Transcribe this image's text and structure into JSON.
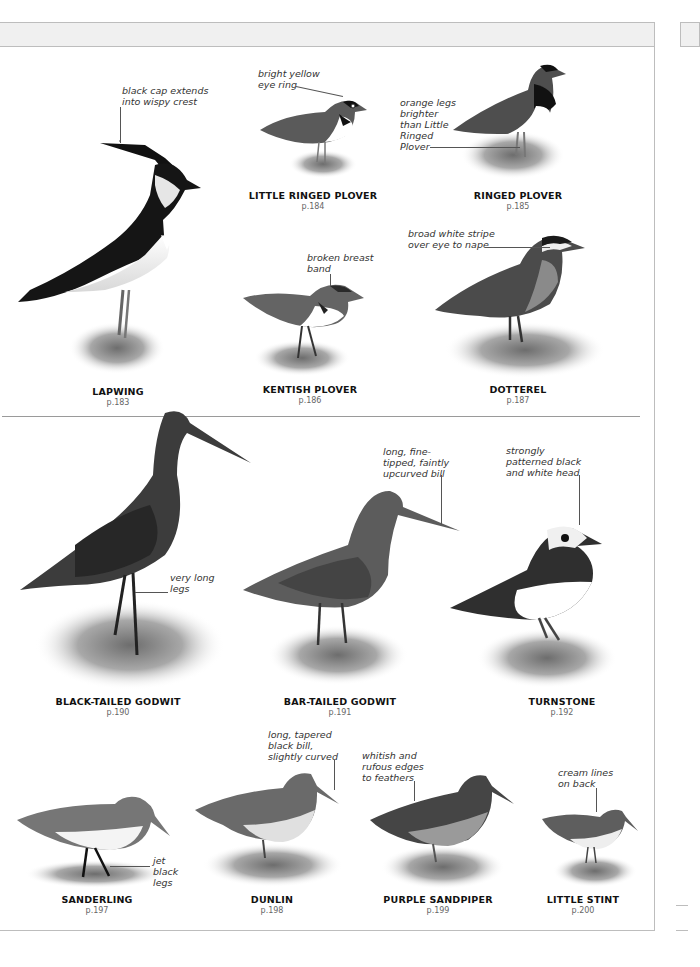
{
  "page": {
    "header_band": "",
    "sections": [
      {
        "id": "plovers",
        "species": [
          {
            "name": "LAPWING",
            "page": "p.183",
            "note": "black cap extends\ninto wispy crest"
          },
          {
            "name": "LITTLE RINGED PLOVER",
            "page": "p.184",
            "note": "bright yellow\neye ring"
          },
          {
            "name": "RINGED PLOVER",
            "page": "p.185",
            "note": "orange legs\nbrighter\nthan Little\nRinged\nPlover"
          },
          {
            "name": "KENTISH PLOVER",
            "page": "p.186",
            "note": "broken breast\nband"
          },
          {
            "name": "DOTTEREL",
            "page": "p.187",
            "note": "broad white stripe\nover eye to nape"
          }
        ]
      },
      {
        "id": "godwits-sandpipers",
        "species": [
          {
            "name": "BLACK-TAILED GODWIT",
            "page": "p.190",
            "note": "very long\nlegs"
          },
          {
            "name": "BAR-TAILED GODWIT",
            "page": "p.191",
            "note": "long, fine-\ntipped, faintly\nupcurved bill"
          },
          {
            "name": "TURNSTONE",
            "page": "p.192",
            "note": "strongly\npatterned black\nand white head"
          },
          {
            "name": "SANDERLING",
            "page": "p.197",
            "note": "jet\nblack\nlegs"
          },
          {
            "name": "DUNLIN",
            "page": "p.198",
            "note": "long, tapered\nblack bill,\nslightly curved"
          },
          {
            "name": "PURPLE SANDPIPER",
            "page": "p.199",
            "note": "whitish and\nrufous edges\nto feathers"
          },
          {
            "name": "LITTLE STINT",
            "page": "p.200",
            "note": "cream lines\non back"
          }
        ]
      }
    ]
  }
}
